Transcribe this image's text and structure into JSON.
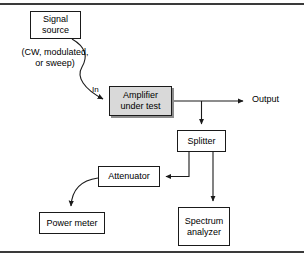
{
  "figure": {
    "kind": "block-diagram",
    "title_visible": false,
    "background_color": "#ffffff",
    "frame": {
      "top_rule_color": "#3a3a3a",
      "bottom_rule_color": "#3a3a3a"
    }
  },
  "blocks": {
    "signal_source": {
      "label": "Signal\nsource",
      "x": 30,
      "y": 11,
      "w": 51,
      "h": 28,
      "fill": "#ffffff"
    },
    "amplifier": {
      "label": "Amplifier\nunder test",
      "x": 109,
      "y": 86,
      "w": 63,
      "h": 30,
      "fill": "#d9d9d9",
      "shadow": "#8d8d8d"
    },
    "splitter": {
      "label": "Splitter",
      "x": 177,
      "y": 130,
      "w": 49,
      "h": 22,
      "fill": "#ffffff"
    },
    "attenuator": {
      "label": "Attenuator",
      "x": 98,
      "y": 166,
      "w": 62,
      "h": 21,
      "fill": "#ffffff"
    },
    "power_meter": {
      "label": "Power meter",
      "x": 39,
      "y": 212,
      "w": 66,
      "h": 22,
      "fill": "#ffffff"
    },
    "spectrum_analyzer": {
      "label": "Spectrum\nanalyzer",
      "x": 178,
      "y": 207,
      "w": 52,
      "h": 39,
      "fill": "#ffffff"
    }
  },
  "labels": {
    "source_modes": {
      "text": "(CW, modulated,\nor sweep)",
      "x": 12,
      "y": 47,
      "w": 86
    },
    "input_port": {
      "text": "In",
      "x": 92,
      "y": 85
    },
    "output_port": {
      "text": "Output",
      "x": 252,
      "y": 95
    }
  },
  "connections": [
    {
      "id": "source-to-amplifier-in",
      "from": "signal_source",
      "to": "amplifier",
      "style": "curved",
      "arrow": "to",
      "port_label": "In"
    },
    {
      "id": "amplifier-to-output",
      "from": "amplifier",
      "to": "output_port",
      "style": "straight",
      "arrow": "to"
    },
    {
      "id": "amplifier-tap-to-splitter",
      "from": "amplifier_output_node",
      "to": "splitter",
      "style": "straight",
      "arrow": "to"
    },
    {
      "id": "splitter-to-attenuator",
      "from": "splitter",
      "to": "attenuator",
      "style": "orthogonal",
      "arrow": "to"
    },
    {
      "id": "splitter-to-spectrum-analyzer",
      "from": "splitter",
      "to": "spectrum_analyzer",
      "style": "straight",
      "arrow": "to"
    },
    {
      "id": "attenuator-to-power-meter",
      "from": "attenuator",
      "to": "power_meter",
      "style": "curved",
      "arrow": "to"
    }
  ],
  "colors": {
    "line": "#1a1a1a",
    "box_border": "#1a1a1a",
    "text": "#000000",
    "shaded_fill": "#d9d9d9"
  }
}
